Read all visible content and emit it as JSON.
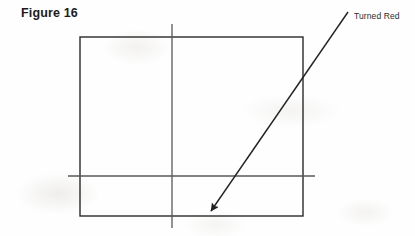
{
  "figure": {
    "title": "Figure 16",
    "callout_label": "Turned Red",
    "canvas": {
      "width": 415,
      "height": 236,
      "background": "#fefefe"
    },
    "colors": {
      "title_text": "#1b1b1b",
      "label_text": "#2b2b2b",
      "rectangle_stroke": "#2a2a2a",
      "guide_line_stroke": "#585858",
      "arrow_stroke": "#222222",
      "background": "#fefefe"
    },
    "shapes": {
      "rectangle": {
        "name": "main-rectangle",
        "x": 80,
        "y": 37,
        "width": 223,
        "height": 179,
        "stroke_width": 1.4,
        "fill": "none"
      },
      "vertical_guide": {
        "name": "vertical-guide-line",
        "x1": 172,
        "y1": 24,
        "x2": 172,
        "y2": 228,
        "stroke_width": 1.3
      },
      "horizontal_guide": {
        "name": "horizontal-guide-line",
        "x1": 68,
        "y1": 176,
        "x2": 315,
        "y2": 176,
        "stroke_width": 1.3
      },
      "callout_arrow": {
        "name": "callout-arrow",
        "x1": 348,
        "y1": 12,
        "x2": 210,
        "y2": 213,
        "stroke_width": 1.4,
        "arrowhead": "solid-triangle",
        "arrowhead_tip_x": 208,
        "arrowhead_tip_y": 215
      }
    }
  }
}
